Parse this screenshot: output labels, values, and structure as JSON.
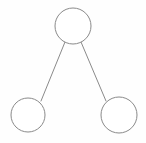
{
  "canvas": {
    "width": 146,
    "height": 143,
    "background_color": "#fefefe"
  },
  "diagram": {
    "type": "tree",
    "title": "",
    "stroke_color": "#8a8a8a",
    "node_fill_color": "#ffffff",
    "stroke_width": 1,
    "node_count": 3,
    "edge_count": 2,
    "nodes": [
      {
        "id": "root",
        "label": "",
        "cx": 73,
        "cy": 26,
        "r": 18
      },
      {
        "id": "child-left",
        "label": "",
        "cx": 28,
        "cy": 115,
        "r": 17
      },
      {
        "id": "child-right",
        "label": "",
        "cx": 119,
        "cy": 115,
        "r": 18
      }
    ],
    "edges": [
      {
        "id": "edge-root-left",
        "from": "root",
        "to": "child-left",
        "x1": 65,
        "y1": 42,
        "x2": 41,
        "y2": 101
      },
      {
        "id": "edge-root-right",
        "from": "root",
        "to": "child-right",
        "x1": 81,
        "y1": 42,
        "x2": 106,
        "y2": 101
      }
    ]
  }
}
